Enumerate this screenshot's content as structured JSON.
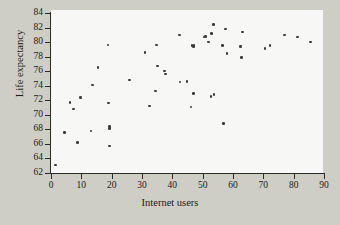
{
  "chart_data": {
    "type": "scatter",
    "title": "",
    "xlabel": "Internet users",
    "ylabel": "Life expectancy",
    "xlim": [
      0,
      90
    ],
    "ylim": [
      62,
      84
    ],
    "xticks": [
      0,
      10,
      20,
      30,
      40,
      50,
      60,
      70,
      80,
      90
    ],
    "yticks": [
      62,
      64,
      66,
      68,
      70,
      72,
      74,
      76,
      78,
      80,
      82,
      84
    ],
    "grid": false,
    "legend": null,
    "marker_color": "#3a3a3a",
    "plot_background": "#f7f7f5",
    "figure_background": "#cecec7",
    "points": [
      {
        "x": 1.5,
        "y": 63.1
      },
      {
        "x": 4.5,
        "y": 67.6
      },
      {
        "x": 6.2,
        "y": 71.7
      },
      {
        "x": 7.5,
        "y": 70.8
      },
      {
        "x": 8.8,
        "y": 66.2
      },
      {
        "x": 9.8,
        "y": 72.4
      },
      {
        "x": 13.2,
        "y": 67.8
      },
      {
        "x": 13.6,
        "y": 74.1
      },
      {
        "x": 15.5,
        "y": 76.5
      },
      {
        "x": 18.8,
        "y": 79.6
      },
      {
        "x": 19.0,
        "y": 71.6
      },
      {
        "x": 19.3,
        "y": 68.4
      },
      {
        "x": 19.3,
        "y": 68.1
      },
      {
        "x": 19.2,
        "y": 65.7
      },
      {
        "x": 25.8,
        "y": 74.8
      },
      {
        "x": 31.0,
        "y": 78.6
      },
      {
        "x": 32.5,
        "y": 71.2
      },
      {
        "x": 34.5,
        "y": 73.3
      },
      {
        "x": 34.8,
        "y": 79.6
      },
      {
        "x": 35.2,
        "y": 76.7
      },
      {
        "x": 37.5,
        "y": 76.0
      },
      {
        "x": 37.8,
        "y": 75.6
      },
      {
        "x": 42.3,
        "y": 81.0
      },
      {
        "x": 42.5,
        "y": 74.5
      },
      {
        "x": 44.8,
        "y": 74.6
      },
      {
        "x": 46.2,
        "y": 71.1
      },
      {
        "x": 46.5,
        "y": 79.5
      },
      {
        "x": 47.0,
        "y": 79.4
      },
      {
        "x": 47.2,
        "y": 79.5
      },
      {
        "x": 47.0,
        "y": 72.9
      },
      {
        "x": 50.5,
        "y": 80.7
      },
      {
        "x": 51.0,
        "y": 80.8
      },
      {
        "x": 52.0,
        "y": 80.0
      },
      {
        "x": 53.0,
        "y": 81.2
      },
      {
        "x": 53.5,
        "y": 82.4
      },
      {
        "x": 53.8,
        "y": 72.8
      },
      {
        "x": 52.8,
        "y": 72.5
      },
      {
        "x": 56.5,
        "y": 79.5
      },
      {
        "x": 56.8,
        "y": 68.8
      },
      {
        "x": 57.5,
        "y": 81.8
      },
      {
        "x": 58.0,
        "y": 78.4
      },
      {
        "x": 62.5,
        "y": 79.4
      },
      {
        "x": 62.8,
        "y": 77.9
      },
      {
        "x": 63.2,
        "y": 81.4
      },
      {
        "x": 70.5,
        "y": 79.1
      },
      {
        "x": 72.2,
        "y": 79.5
      },
      {
        "x": 77.0,
        "y": 81.0
      },
      {
        "x": 81.2,
        "y": 80.7
      },
      {
        "x": 85.5,
        "y": 80.0
      }
    ]
  }
}
